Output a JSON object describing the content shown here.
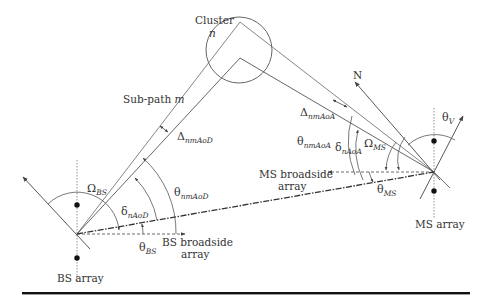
{
  "diagram": {
    "type": "geometric",
    "colors": {
      "line": "#555555",
      "text": "#333333",
      "rule": "#111111",
      "background": "#ffffff"
    },
    "labels": {
      "cluster": "Cluster",
      "cluster_index": "n",
      "subpath": "Sub-path",
      "subpath_index": "m",
      "north": "N",
      "bs_array": "BS array",
      "ms_array": "MS array",
      "bs_broadside_1": "BS broadside",
      "bs_broadside_2": "array",
      "ms_broadside_1": "MS broadside",
      "ms_broadside_2": "array"
    },
    "symbols": {
      "omega": "Ω",
      "theta": "θ",
      "delta_small": "δ",
      "delta_big": "Δ",
      "omega_bs_sub": "BS",
      "omega_ms_sub": "MS",
      "theta_bs_sub": "BS",
      "theta_ms_sub": "MS",
      "theta_v_sub": "V",
      "delta_naod_sub": "nAoD",
      "delta_naoa_sub": "nAoA",
      "theta_nmaod_sub": "nmAoD",
      "theta_nmaoa_sub": "nmAoA",
      "Delta_nmaod_sub": "nmAoD",
      "Delta_nmaoa_sub": "nmAoA"
    },
    "nodes": [
      {
        "id": "bs",
        "label": "BS array",
        "x": 77,
        "y": 234
      },
      {
        "id": "ms",
        "label": "MS array",
        "x": 434,
        "y": 172
      },
      {
        "id": "cluster",
        "label": "Cluster n",
        "x": 239,
        "y": 50,
        "r": 33
      }
    ],
    "edges": [
      {
        "from": "bs",
        "to": "ms",
        "style": "dash-dot",
        "label": "LOS"
      },
      {
        "from": "bs",
        "to": "cluster",
        "style": "solid",
        "label": "Sub-path m"
      },
      {
        "from": "cluster",
        "to": "ms",
        "style": "solid"
      }
    ]
  }
}
